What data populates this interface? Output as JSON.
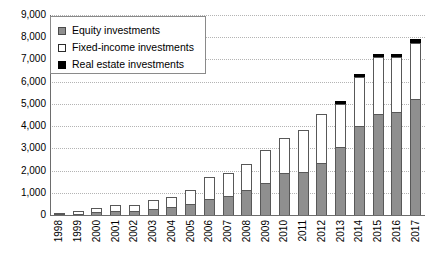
{
  "chart_data": {
    "type": "bar",
    "stacked": true,
    "title": "",
    "xlabel": "",
    "ylabel": "",
    "ylim": [
      0,
      9000
    ],
    "ytick_labels": [
      "9,000",
      "8,000",
      "7,000",
      "6,000",
      "5,000",
      "4,000",
      "3,000",
      "2,000",
      "1,000",
      "0"
    ],
    "ytick_values": [
      9000,
      8000,
      7000,
      6000,
      5000,
      4000,
      3000,
      2000,
      1000,
      0
    ],
    "grid": true,
    "legend_position": "top-left",
    "categories": [
      "1998",
      "1999",
      "2000",
      "2001",
      "2002",
      "2003",
      "2004",
      "2005",
      "2006",
      "2007",
      "2008",
      "2009",
      "2010",
      "2011",
      "2012",
      "2013",
      "2014",
      "2015",
      "2016",
      "2017"
    ],
    "series": [
      {
        "name": "Equity investments",
        "color": "#8f8f8f",
        "values": [
          60,
          110,
          160,
          210,
          220,
          320,
          400,
          560,
          760,
          900,
          1150,
          1500,
          1950,
          2000,
          2400,
          3100,
          4050,
          4600,
          4700,
          5250
        ]
      },
      {
        "name": "Fixed-income investments",
        "color": "#ffffff",
        "values": [
          90,
          140,
          240,
          340,
          330,
          430,
          500,
          640,
          1040,
          1100,
          1250,
          1500,
          1600,
          1900,
          2250,
          2000,
          2250,
          2600,
          2500,
          2600
        ]
      },
      {
        "name": "Real estate investments",
        "color": "#000000",
        "values": [
          0,
          0,
          0,
          0,
          0,
          0,
          0,
          0,
          0,
          0,
          0,
          0,
          0,
          0,
          0,
          160,
          180,
          200,
          200,
          200
        ]
      }
    ],
    "totals": [
      150,
      250,
      400,
      550,
      550,
      750,
      900,
      1200,
      1800,
      2000,
      2400,
      3000,
      3550,
      3900,
      4650,
      5260,
      6480,
      7400,
      7400,
      8050
    ]
  },
  "legend": {
    "items": [
      {
        "label": "Equity investments",
        "swatch": "gray-square-icon"
      },
      {
        "label": "Fixed-income investments",
        "swatch": "white-square-icon"
      },
      {
        "label": "Real estate investments",
        "swatch": "black-square-icon"
      }
    ]
  }
}
